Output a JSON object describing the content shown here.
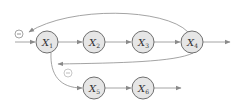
{
  "diagram": {
    "type": "directed-graph",
    "nodes": [
      {
        "id": "X1",
        "label": "X",
        "sub": "1",
        "x": 47,
        "y": 42
      },
      {
        "id": "X2",
        "label": "X",
        "sub": "2",
        "x": 94,
        "y": 42
      },
      {
        "id": "X3",
        "label": "X",
        "sub": "3",
        "x": 143,
        "y": 42
      },
      {
        "id": "X4",
        "label": "X",
        "sub": "4",
        "x": 192,
        "y": 42
      },
      {
        "id": "X5",
        "label": "X",
        "sub": "5",
        "x": 94,
        "y": 88
      },
      {
        "id": "X6",
        "label": "X",
        "sub": "6",
        "x": 143,
        "y": 88
      }
    ],
    "edges": [
      {
        "from": "input",
        "to": "X1"
      },
      {
        "from": "X1",
        "to": "X2"
      },
      {
        "from": "X2",
        "to": "X3"
      },
      {
        "from": "X3",
        "to": "X4"
      },
      {
        "from": "X4",
        "to": "output"
      },
      {
        "from": "X4",
        "to": "input-junction",
        "kind": "feedback-top",
        "sign": "−"
      },
      {
        "from": "X4",
        "to": "X1",
        "kind": "feedback-bottom"
      },
      {
        "from": "X1",
        "to": "X5",
        "sign": "−"
      },
      {
        "from": "X5",
        "to": "X6"
      },
      {
        "from": "X6",
        "to": "output"
      }
    ],
    "signs": [
      {
        "id": "sign-top-feedback",
        "symbol": "−",
        "x": 19,
        "y": 34
      },
      {
        "id": "sign-x1-x5",
        "symbol": "−",
        "x": 68,
        "y": 73
      }
    ],
    "colors": {
      "node_fill": "#e6e6e6",
      "node_stroke": "#6f6f6f",
      "edge": "#9a9a9a",
      "background": "#ffffff"
    }
  }
}
